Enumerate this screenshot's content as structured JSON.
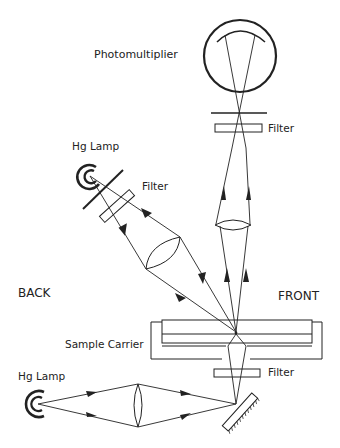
{
  "diagram": {
    "type": "optical-setup",
    "labels": {
      "photomultiplier": "Photomultiplier",
      "filter_top": "Filter",
      "hg_lamp_back": "Hg Lamp",
      "filter_back": "Filter",
      "back": "BACK",
      "front": "FRONT",
      "sample_carrier": "Sample Carrier",
      "filter_bottom": "Filter",
      "hg_lamp_bottom": "Hg Lamp"
    },
    "components": [
      {
        "id": "photomultiplier",
        "kind": "detector"
      },
      {
        "id": "filter_top",
        "kind": "filter"
      },
      {
        "id": "lens_front",
        "kind": "lens"
      },
      {
        "id": "hg_lamp_back",
        "kind": "light-source"
      },
      {
        "id": "filter_back",
        "kind": "filter"
      },
      {
        "id": "lens_back",
        "kind": "lens"
      },
      {
        "id": "sample_carrier",
        "kind": "sample-holder"
      },
      {
        "id": "filter_bottom",
        "kind": "filter"
      },
      {
        "id": "mirror",
        "kind": "mirror"
      },
      {
        "id": "lens_bottom",
        "kind": "lens"
      },
      {
        "id": "hg_lamp_bottom",
        "kind": "light-source"
      }
    ],
    "colors": {
      "ink": "#222222",
      "background": "#ffffff"
    }
  }
}
